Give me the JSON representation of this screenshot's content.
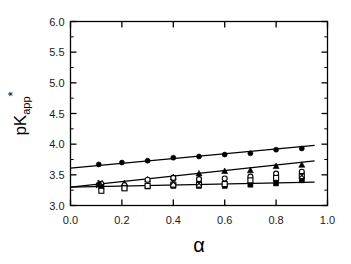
{
  "chart_data": {
    "type": "scatter",
    "title": "",
    "subtitle": "",
    "xlabel": "α",
    "ylabel_main": "pK",
    "ylabel_sub": "app",
    "ylabel_sup": "*",
    "xlim": [
      0.0,
      1.0
    ],
    "ylim": [
      3.0,
      6.0
    ],
    "xticks": [
      0.0,
      0.2,
      0.4,
      0.6,
      0.8,
      1.0
    ],
    "xticklabels": [
      "0.0",
      "0.2",
      "0.4",
      "0.6",
      "0.8",
      "1.0"
    ],
    "yticks": [
      3.0,
      3.5,
      4.0,
      4.5,
      5.0,
      5.5,
      6.0
    ],
    "yticklabels": [
      "3.0",
      "3.5",
      "4.0",
      "4.5",
      "5.0",
      "5.5",
      "6.0"
    ],
    "xminorticks": [
      0.1,
      0.3,
      0.5,
      0.7,
      0.9
    ],
    "yminorticks": [
      3.25,
      3.75,
      4.25,
      4.75,
      5.25,
      5.75
    ],
    "grid": false,
    "legend": false,
    "legend_position": "none",
    "frame": true,
    "line_color": "#000000",
    "marker_color": "#000000",
    "series": [
      {
        "name": "filled-circle-series",
        "marker": "filled-circle",
        "x": [
          0.11,
          0.2,
          0.3,
          0.4,
          0.5,
          0.6,
          0.7,
          0.8,
          0.9
        ],
        "y": [
          3.67,
          3.7,
          3.73,
          3.78,
          3.8,
          3.83,
          3.85,
          3.91,
          3.93
        ],
        "fit": {
          "intercept": 3.61,
          "slope": 0.39,
          "x_start": 0.0,
          "x_end": 0.95
        }
      },
      {
        "name": "filled-triangle-series",
        "marker": "filled-triangle",
        "x": [
          0.11,
          0.12,
          0.21,
          0.3,
          0.4,
          0.5,
          0.6,
          0.7,
          0.8,
          0.9
        ],
        "y": [
          3.36,
          3.34,
          3.36,
          3.42,
          3.46,
          3.52,
          3.56,
          3.57,
          3.64,
          3.66
        ],
        "fit": {
          "intercept": 3.3,
          "slope": 0.45,
          "x_start": 0.0,
          "x_end": 0.95
        }
      },
      {
        "name": "open-circle-series",
        "marker": "open-circle",
        "x": [
          0.12,
          0.21,
          0.3,
          0.4,
          0.5,
          0.6,
          0.7,
          0.8,
          0.9
        ],
        "y": [
          3.35,
          3.33,
          3.42,
          3.45,
          3.43,
          3.44,
          3.47,
          3.52,
          3.55
        ]
      },
      {
        "name": "filled-square-series",
        "marker": "filled-square",
        "x": [
          0.12,
          0.21,
          0.3,
          0.4,
          0.5,
          0.6,
          0.7,
          0.8,
          0.9
        ],
        "y": [
          3.3,
          3.29,
          3.31,
          3.32,
          3.32,
          3.32,
          3.34,
          3.36,
          3.41
        ],
        "fit": {
          "intercept": 3.3,
          "slope": 0.085,
          "x_start": 0.0,
          "x_end": 0.95
        }
      },
      {
        "name": "open-square-series",
        "marker": "open-square",
        "x": [
          0.12,
          0.21,
          0.3,
          0.4,
          0.5,
          0.6,
          0.7,
          0.8,
          0.9
        ],
        "y": [
          3.24,
          3.28,
          3.32,
          3.34,
          3.34,
          3.35,
          3.41,
          3.45,
          3.48
        ]
      },
      {
        "name": "cross-series",
        "marker": "cross",
        "x": [
          0.11,
          0.115,
          0.4,
          0.5,
          0.9
        ],
        "y": [
          3.33,
          3.37,
          3.38,
          3.36,
          3.49
        ]
      }
    ]
  }
}
